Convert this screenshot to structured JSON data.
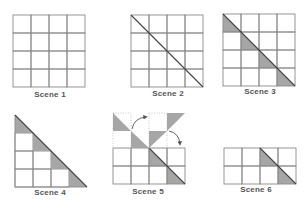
{
  "colors": {
    "grid_line": "#8a8a8a",
    "shade": "#a6a6a6",
    "diagonal": "#444444",
    "label": "#555555",
    "dotted": "#bbbbbb",
    "arrow": "#555555"
  },
  "cell_size": 18,
  "scenes": [
    {
      "id": "scene-1",
      "label": "Scene 1",
      "label_pos": {
        "x": 50,
        "y": 90
      },
      "origin": {
        "x": 13,
        "y": 15
      },
      "cols": 4,
      "rows": 4,
      "diagonal": false,
      "shaded_triangles": []
    },
    {
      "id": "scene-2",
      "label": "Scene 2",
      "label_pos": {
        "x": 168,
        "y": 89
      },
      "origin": {
        "x": 131,
        "y": 15
      },
      "cols": 4,
      "rows": 4,
      "diagonal": true,
      "shaded_triangles": []
    },
    {
      "id": "scene-3",
      "label": "Scene 3",
      "label_pos": {
        "x": 260,
        "y": 87
      },
      "origin": {
        "x": 223,
        "y": 14
      },
      "cols": 4,
      "rows": 4,
      "diagonal": true,
      "shaded_triangles": [
        [
          0,
          0
        ],
        [
          1,
          1
        ],
        [
          2,
          2
        ],
        [
          3,
          3
        ]
      ]
    },
    {
      "id": "scene-4",
      "label": "Scene 4",
      "label_pos": {
        "x": 50,
        "y": 188
      },
      "origin": {
        "x": 15,
        "y": 115
      },
      "cols": 4,
      "rows": 4,
      "staircase": true,
      "diagonal": true,
      "shaded_triangles": [
        [
          0,
          0
        ],
        [
          1,
          1
        ],
        [
          2,
          2
        ],
        [
          3,
          3
        ]
      ]
    },
    {
      "id": "scene-5",
      "label": "Scene 5",
      "label_pos": {
        "x": 148,
        "y": 187
      },
      "origin": {
        "x": 113,
        "y": 148
      },
      "cols": 4,
      "rows": 2,
      "diagonal_from_col": 2,
      "shaded_triangles": [
        [
          0,
          2
        ],
        [
          1,
          3
        ]
      ],
      "moving_pieces": [
        {
          "x": 113,
          "y": 113,
          "type": "tri-bl-dotted"
        },
        {
          "x": 131,
          "y": 131,
          "type": "tri-bl-dotted"
        },
        {
          "x": 149,
          "y": 113,
          "type": "tri-tr-dotted"
        },
        {
          "x": 149,
          "y": 131,
          "type": "tri-tr-dotted-low"
        }
      ],
      "arrows": [
        {
          "from": [
            133,
            128
          ],
          "to": [
            146,
            118
          ]
        },
        {
          "from": [
            170,
            130
          ],
          "to": [
            181,
            144
          ]
        }
      ]
    },
    {
      "id": "scene-6",
      "label": "Scene 6",
      "label_pos": {
        "x": 256,
        "y": 185
      },
      "origin": {
        "x": 224,
        "y": 148
      },
      "cols": 4,
      "rows": 2,
      "diagonal_from_col": 2,
      "shaded_triangles": [
        [
          0,
          2
        ],
        [
          1,
          3
        ]
      ]
    }
  ]
}
